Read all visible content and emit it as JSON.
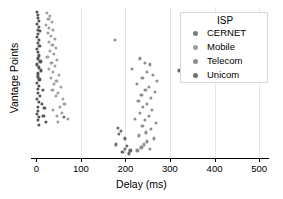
{
  "chart_data": {
    "type": "scatter",
    "title": "",
    "xlabel": "Delay (ms)",
    "ylabel": "Vantage Points",
    "xlim": [
      -12,
      520
    ],
    "ylim": [
      0,
      100
    ],
    "xticks": [
      "0",
      "100",
      "200",
      "300",
      "400",
      "500"
    ],
    "xtick_values": [
      0,
      100,
      200,
      300,
      400,
      500
    ],
    "yticks": [],
    "grid": "vertical-only",
    "legend": {
      "title": "ISP",
      "position": "upper-right",
      "entries": [
        {
          "name": "CERNET",
          "color": "#7a7a7a"
        },
        {
          "name": "Mobile",
          "color": "#9e9e9e"
        },
        {
          "name": "Telecom",
          "color": "#8d8d8d"
        },
        {
          "name": "Unicom",
          "color": "#6f6f6f"
        }
      ]
    },
    "series": [
      {
        "name": "CERNET",
        "color": "#555555",
        "points": [
          [
            2,
            97
          ],
          [
            3,
            95
          ],
          [
            4,
            93
          ],
          [
            5,
            91
          ],
          [
            2,
            89
          ],
          [
            6,
            87
          ],
          [
            3,
            85
          ],
          [
            8,
            84
          ],
          [
            4,
            82
          ],
          [
            2,
            80
          ],
          [
            5,
            78
          ],
          [
            3,
            76
          ],
          [
            7,
            74
          ],
          [
            2,
            72
          ],
          [
            4,
            70
          ],
          [
            6,
            68
          ],
          [
            3,
            66
          ],
          [
            9,
            64
          ],
          [
            2,
            62
          ],
          [
            5,
            60
          ],
          [
            11,
            58
          ],
          [
            4,
            56
          ],
          [
            3,
            54
          ],
          [
            7,
            52
          ],
          [
            2,
            50
          ],
          [
            6,
            48
          ],
          [
            4,
            46
          ],
          [
            14,
            45
          ],
          [
            3,
            43
          ],
          [
            8,
            41
          ],
          [
            2,
            39
          ],
          [
            5,
            37
          ],
          [
            12,
            36
          ],
          [
            3,
            34
          ],
          [
            18,
            33
          ],
          [
            4,
            31
          ],
          [
            2,
            29
          ],
          [
            16,
            28
          ],
          [
            6,
            27
          ],
          [
            3,
            25
          ],
          [
            21,
            24
          ],
          [
            5,
            22
          ]
        ]
      },
      {
        "name": "Mobile",
        "color": "#a0a0a0",
        "points": [
          [
            24,
            96
          ],
          [
            31,
            94
          ],
          [
            27,
            92
          ],
          [
            35,
            90
          ],
          [
            22,
            88
          ],
          [
            29,
            86
          ],
          [
            38,
            85
          ],
          [
            26,
            83
          ],
          [
            33,
            81
          ],
          [
            41,
            79
          ],
          [
            28,
            77
          ],
          [
            36,
            75
          ],
          [
            44,
            73
          ],
          [
            30,
            71
          ],
          [
            39,
            69
          ],
          [
            25,
            67
          ],
          [
            47,
            65
          ],
          [
            34,
            63
          ],
          [
            42,
            61
          ],
          [
            29,
            59
          ],
          [
            37,
            57
          ],
          [
            51,
            55
          ],
          [
            32,
            53
          ],
          [
            45,
            51
          ],
          [
            40,
            49
          ],
          [
            55,
            47
          ],
          [
            36,
            45
          ],
          [
            48,
            43
          ],
          [
            43,
            41
          ],
          [
            59,
            39
          ],
          [
            63,
            36
          ],
          [
            52,
            34
          ],
          [
            38,
            32
          ],
          [
            57,
            30
          ],
          [
            46,
            28
          ],
          [
            70,
            26
          ],
          [
            49,
            24
          ]
        ]
      },
      {
        "name": "Telecom",
        "color": "#8f8f8f",
        "points": [
          [
            176,
            78
          ],
          [
            232,
            66
          ],
          [
            243,
            63
          ],
          [
            255,
            62
          ],
          [
            214,
            59
          ],
          [
            249,
            57
          ],
          [
            262,
            55
          ],
          [
            238,
            53
          ],
          [
            271,
            51
          ],
          [
            226,
            49
          ],
          [
            253,
            47
          ],
          [
            245,
            45
          ],
          [
            266,
            44
          ],
          [
            236,
            42
          ],
          [
            258,
            40
          ],
          [
            229,
            38
          ],
          [
            248,
            36
          ],
          [
            240,
            34
          ],
          [
            260,
            32
          ],
          [
            233,
            30
          ],
          [
            252,
            28
          ],
          [
            222,
            26
          ],
          [
            244,
            25
          ],
          [
            269,
            23
          ],
          [
            238,
            21
          ],
          [
            257,
            19
          ],
          [
            246,
            17
          ],
          [
            230,
            15
          ],
          [
            263,
            13
          ],
          [
            249,
            11
          ],
          [
            241,
            9
          ],
          [
            236,
            7
          ],
          [
            254,
            6
          ],
          [
            227,
            5
          ]
        ]
      },
      {
        "name": "Unicom",
        "color": "#6b6b6b",
        "points": [
          [
            62,
            27
          ],
          [
            183,
            20
          ],
          [
            189,
            18
          ],
          [
            186,
            16
          ],
          [
            178,
            9
          ],
          [
            203,
            8
          ],
          [
            199,
            6
          ],
          [
            211,
            5
          ],
          [
            193,
            4
          ],
          [
            207,
            3
          ],
          [
            320,
            58
          ],
          [
            198,
            13
          ]
        ]
      }
    ]
  }
}
